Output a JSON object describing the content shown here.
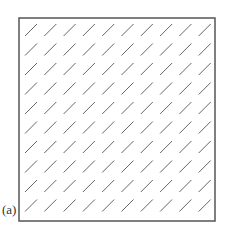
{
  "figure": {
    "panel_label": "(a)",
    "frame": {
      "x": 19,
      "y": 18,
      "width": 196,
      "height": 203,
      "stroke": "#555555",
      "stroke_width": 1.5
    },
    "grid": {
      "rows": 10,
      "cols": 10,
      "start_x": 25,
      "start_y": 24,
      "step_x": 19.3,
      "step_y": 19.5,
      "dash_dx": 12,
      "dash_dy": -12,
      "dash_color": "#666666",
      "dash_width": 1
    }
  }
}
